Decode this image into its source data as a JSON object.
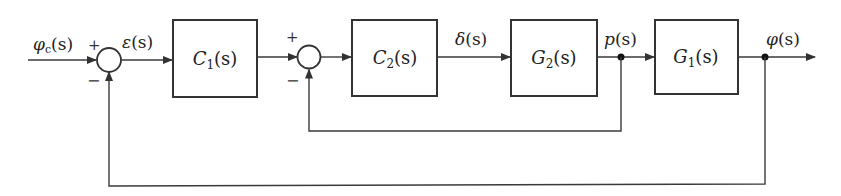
{
  "diagram": {
    "type": "cascade control block diagram",
    "signals": {
      "input": {
        "main": "φ",
        "sub": "c",
        "arg": "(s)"
      },
      "error": {
        "main": "ε",
        "arg": "(s)"
      },
      "delta": {
        "main": "δ",
        "arg": "(s)"
      },
      "p": {
        "main": "p",
        "arg": "(s)"
      },
      "output": {
        "main": "φ",
        "arg": "(s)"
      }
    },
    "blocks": [
      {
        "id": "C1",
        "main": "C",
        "sub": "1",
        "arg": "(s)"
      },
      {
        "id": "C2",
        "main": "C",
        "sub": "2",
        "arg": "(s)"
      },
      {
        "id": "G2",
        "main": "G",
        "sub": "2",
        "arg": "(s)"
      },
      {
        "id": "G1",
        "main": "G",
        "sub": "1",
        "arg": "(s)"
      }
    ],
    "summing_junctions": [
      {
        "id": "sum1",
        "plus": "+",
        "minus": "−"
      },
      {
        "id": "sum2",
        "plus": "+",
        "minus": "−"
      }
    ],
    "connections": [
      "φc(s) → sum1(+)",
      "sum1 → ε(s) → C1(s)",
      "C1(s) → sum2(+)",
      "sum2 → C2(s)",
      "C2(s) → δ(s) → G2(s)",
      "G2(s) → p(s) → G1(s)",
      "p(s) → sum2(−) [inner feedback]",
      "G1(s) → φ(s) → output",
      "φ(s) → sum1(−) [outer feedback]"
    ]
  }
}
